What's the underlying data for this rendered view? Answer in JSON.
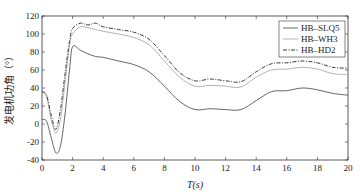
{
  "chart_data": {
    "type": "line",
    "title": "",
    "xlabel": "T(s)",
    "ylabel": "发电机功角（°）",
    "xlim": [
      0,
      20
    ],
    "ylim": [
      -40,
      120
    ],
    "xticks": [
      0,
      2,
      4,
      6,
      8,
      10,
      12,
      14,
      16,
      18,
      20
    ],
    "yticks": [
      -40,
      -20,
      0,
      20,
      40,
      60,
      80,
      100,
      120
    ],
    "grid": false,
    "legend_position": "upper right",
    "series": [
      {
        "name": "HB–SLQ5",
        "style": "solid",
        "color": "#555555",
        "x": [
          0,
          0.3,
          0.6,
          0.9,
          1.2,
          1.5,
          1.8,
          2.0,
          2.5,
          3,
          3.5,
          4,
          5,
          6,
          7,
          8,
          9,
          10,
          11,
          12,
          13,
          14,
          15,
          16,
          17,
          18,
          19,
          20
        ],
        "y": [
          5,
          3,
          -15,
          -32,
          -25,
          10,
          60,
          86,
          82,
          78,
          75,
          74,
          70,
          66,
          58,
          42,
          25,
          16,
          17,
          16,
          16,
          26,
          36,
          37,
          40,
          38,
          34,
          32
        ]
      },
      {
        "name": "HB–WH3",
        "style": "solid",
        "color": "#aaaaaa",
        "x": [
          0,
          0.3,
          0.6,
          0.9,
          1.2,
          1.5,
          1.8,
          2.0,
          2.5,
          3,
          3.5,
          4,
          5,
          6,
          7,
          8,
          9,
          10,
          11,
          12,
          13,
          14,
          15,
          16,
          17,
          18,
          19,
          20
        ],
        "y": [
          36,
          30,
          5,
          -10,
          5,
          45,
          88,
          100,
          108,
          107,
          105,
          103,
          100,
          96,
          88,
          70,
          52,
          42,
          43,
          42,
          41,
          52,
          60,
          61,
          63,
          61,
          56,
          55
        ]
      },
      {
        "name": "HB–HD2",
        "style": "dashdot",
        "color": "#222222",
        "x": [
          0,
          0.3,
          0.6,
          0.9,
          1.2,
          1.5,
          1.8,
          2.0,
          2.5,
          3,
          3.5,
          4,
          5,
          6,
          7,
          8,
          9,
          10,
          11,
          12,
          13,
          14,
          15,
          16,
          17,
          18,
          19,
          20
        ],
        "y": [
          36,
          32,
          10,
          -6,
          15,
          55,
          92,
          106,
          112,
          110,
          112,
          108,
          105,
          102,
          94,
          76,
          57,
          48,
          50,
          48,
          47,
          58,
          67,
          68,
          70,
          68,
          63,
          62
        ]
      }
    ]
  }
}
